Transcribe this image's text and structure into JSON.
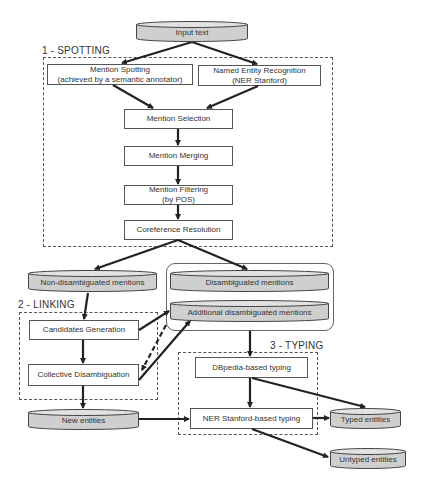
{
  "diagram": {
    "sections": {
      "spotting": "1 - SPOTTING",
      "linking": "2 - LINKING",
      "typing": "3 - TYPING"
    },
    "nodes": {
      "input_text": "Input text",
      "mention_spotting_line1": "Mention Spotting",
      "mention_spotting_line2": "(achieved by a semantic annotator)",
      "ner_line1": "Named Entity Recognition",
      "ner_line2": "(NER Stanford)",
      "mention_selection": "Mention Selection",
      "mention_merging": "Mention Merging",
      "mention_filtering_line1": "Mention Filtering",
      "mention_filtering_line2": "(by POS)",
      "coreference_resolution": "Coreference Resolution",
      "non_disambiguated_mentions": "Non-disambiguated mentions",
      "disambiguated_mentions": "Disambiguated mentions",
      "additional_disambiguated_mentions": "Additional disambiguated mentions",
      "candidates_generation": "Candidates Generation",
      "collective_disambiguation": "Collective Disambiguation",
      "new_entities": "New entities",
      "dbpedia_typing": "DBpedia-based typing",
      "ner_stanford_typing": "NER Stanford-based typing",
      "typed_entities": "Typed entities",
      "untyped_entities": "Untyped entities"
    },
    "edges": [
      {
        "from": "input_text",
        "to": "mention_spotting"
      },
      {
        "from": "input_text",
        "to": "ner"
      },
      {
        "from": "mention_spotting",
        "to": "mention_selection"
      },
      {
        "from": "ner",
        "to": "mention_selection"
      },
      {
        "from": "mention_selection",
        "to": "mention_merging"
      },
      {
        "from": "mention_merging",
        "to": "mention_filtering"
      },
      {
        "from": "mention_filtering",
        "to": "coreference_resolution"
      },
      {
        "from": "coreference_resolution",
        "to": "non_disambiguated_mentions"
      },
      {
        "from": "coreference_resolution",
        "to": "disambiguated_mentions"
      },
      {
        "from": "non_disambiguated_mentions",
        "to": "candidates_generation"
      },
      {
        "from": "candidates_generation",
        "to": "additional_disambiguated_mentions"
      },
      {
        "from": "candidates_generation",
        "to": "collective_disambiguation"
      },
      {
        "from": "additional_disambiguated_mentions",
        "to": "collective_disambiguation",
        "style": "dashed"
      },
      {
        "from": "collective_disambiguation",
        "to": "additional_disambiguated_mentions"
      },
      {
        "from": "collective_disambiguation",
        "to": "new_entities"
      },
      {
        "from": "disambiguated_group",
        "to": "dbpedia_typing"
      },
      {
        "from": "dbpedia_typing",
        "to": "ner_stanford_typing"
      },
      {
        "from": "dbpedia_typing",
        "to": "typed_entities"
      },
      {
        "from": "new_entities",
        "to": "ner_stanford_typing"
      },
      {
        "from": "ner_stanford_typing",
        "to": "typed_entities"
      },
      {
        "from": "ner_stanford_typing",
        "to": "untyped_entities"
      }
    ],
    "colors": {
      "cylinder_fill": "#cfcfcf",
      "cylinder_top": "#e2e2e2",
      "stroke": "#444444",
      "arrow": "#222222"
    }
  }
}
